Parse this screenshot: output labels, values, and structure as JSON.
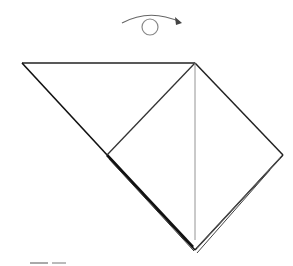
{
  "diagram": {
    "type": "origami-instruction",
    "step_symbol": "turn-over-arrow",
    "symbols": [
      {
        "name": "turn-over-icon",
        "meaning": "turn model over"
      },
      {
        "name": "next-step-arrow-icon",
        "meaning": "arrow at bottom left"
      }
    ],
    "colors": {
      "line": "#222222",
      "thin_line": "#777777",
      "background": "#ffffff"
    }
  }
}
